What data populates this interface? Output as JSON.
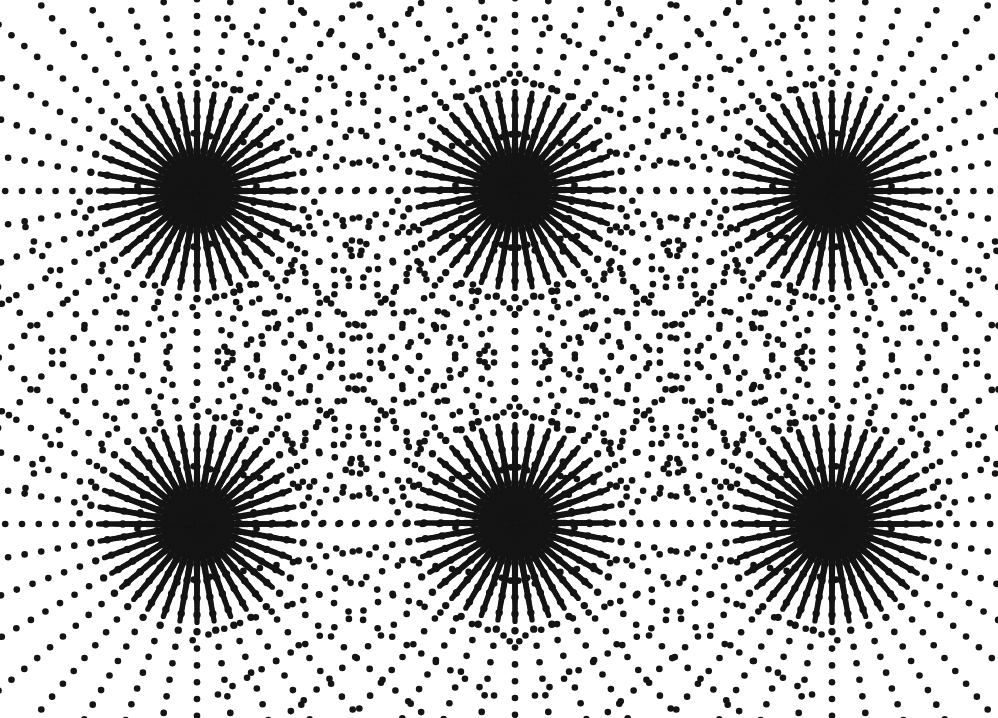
{
  "page": {
    "width": 998,
    "height": 718,
    "background_color": "#ffffff",
    "ink_color": "#141414"
  },
  "scanline": {
    "name": "top-edge-scan-artifact",
    "color": "#d8d8d8",
    "height_px": 2
  },
  "chart_data": {
    "type": "scatter",
    "xlabel": "",
    "ylabel": "",
    "xlim": [
      0,
      998
    ],
    "ylim": [
      0,
      718
    ],
    "grid": false,
    "legend_position": "none",
    "marker": {
      "shape": "circle",
      "color": "#141414",
      "diameter_px": 6.6,
      "core_diameter_px": 7.4
    },
    "pattern": {
      "ray_count": 36,
      "ray_angle_step_deg": 10,
      "ray_angle_offset_deg": 0,
      "dot_spacing_px": 16.8,
      "inner_radius_px": 7,
      "outer_radius_px": 352,
      "core_fill_radius_px": 31
    },
    "series": [
      {
        "name": "burst-top-left",
        "center": [
          197,
          191
        ],
        "rays": 36,
        "dot_spacing": 16.8,
        "max_radius": 352
      },
      {
        "name": "burst-top-center",
        "center": [
          515,
          190
        ],
        "rays": 36,
        "dot_spacing": 16.8,
        "max_radius": 352
      },
      {
        "name": "burst-top-right",
        "center": [
          832,
          191
        ],
        "rays": 36,
        "dot_spacing": 16.8,
        "max_radius": 352
      },
      {
        "name": "burst-bottom-left",
        "center": [
          197,
          524
        ],
        "rays": 36,
        "dot_spacing": 16.8,
        "max_radius": 352
      },
      {
        "name": "burst-bottom-center",
        "center": [
          515,
          523
        ],
        "rays": 36,
        "dot_spacing": 16.8,
        "max_radius": 352
      },
      {
        "name": "burst-bottom-right",
        "center": [
          832,
          524
        ],
        "rays": 36,
        "dot_spacing": 16.8,
        "max_radius": 352
      }
    ],
    "grid_layout": {
      "columns": 3,
      "rows": 2,
      "column_centers_x": [
        197,
        515,
        832
      ],
      "row_centers_y": [
        191,
        524
      ],
      "column_pitch_px": 317,
      "row_pitch_px": 333
    }
  }
}
